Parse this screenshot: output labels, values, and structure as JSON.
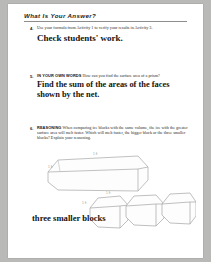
{
  "page": {
    "section_heading": "What Is Your Answer?"
  },
  "items": [
    {
      "number": "4.",
      "prompt": "Use your formula from Activity 1 to verify your results in Activity 3.",
      "answer": "Check students' work."
    },
    {
      "number": "5.",
      "tagline": "IN YOUR OWN WORDS",
      "prompt": "How can you find the surface area of a prism?",
      "answer_line1": "Find the sum of the areas of the faces",
      "answer_line2": "shown by the net."
    },
    {
      "number": "6.",
      "tagline": "REASONING",
      "prompt": "When comparing ice blocks with the same volume, the ice with the greater surface area will melt faster. Which will melt faster, the bigger block or the three smaller blocks? Explain your reasoning.",
      "answer": "three smaller blocks"
    }
  ],
  "illustration": {
    "name": "ice-blocks-diagram",
    "big_block_labels": [
      "1 ft",
      "1 ft"
    ],
    "small_blocks_labels": [
      "1 ft",
      "1 ft",
      "1 ft"
    ],
    "big_block_count": 1,
    "small_block_count": 3
  },
  "colors": {
    "page_background": "#ffffff",
    "canvas_background": "#b9b9b7",
    "text": "#1a1a1a",
    "rule": "#8d8d8d",
    "illustration_stroke": "#9a9a9a"
  }
}
